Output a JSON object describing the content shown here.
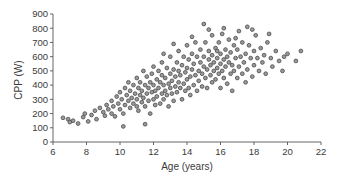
{
  "chart_data": {
    "type": "scatter",
    "title": "",
    "xlabel": "Age (years)",
    "ylabel": "CPP (W)",
    "xlim": [
      6,
      22
    ],
    "ylim": [
      0,
      900
    ],
    "x_ticks": [
      6,
      8,
      10,
      12,
      14,
      16,
      18,
      20,
      22
    ],
    "y_ticks": [
      0,
      100,
      200,
      300,
      400,
      500,
      600,
      700,
      800,
      900
    ],
    "grid": false,
    "legend": null,
    "marker": {
      "shape": "circle",
      "fill": "#9a9a9a",
      "stroke": "#4a4a4a"
    },
    "series": [
      {
        "name": "CPP vs Age",
        "points": [
          [
            6.6,
            170
          ],
          [
            6.9,
            160
          ],
          [
            7.0,
            140
          ],
          [
            7.2,
            150
          ],
          [
            7.5,
            130
          ],
          [
            7.8,
            175
          ],
          [
            7.9,
            200
          ],
          [
            8.1,
            145
          ],
          [
            8.3,
            190
          ],
          [
            8.5,
            220
          ],
          [
            8.6,
            160
          ],
          [
            8.8,
            240
          ],
          [
            9.0,
            210
          ],
          [
            9.1,
            185
          ],
          [
            9.2,
            260
          ],
          [
            9.3,
            230
          ],
          [
            9.5,
            200
          ],
          [
            9.5,
            290
          ],
          [
            9.6,
            250
          ],
          [
            9.7,
            180
          ],
          [
            9.8,
            320
          ],
          [
            9.9,
            270
          ],
          [
            10.0,
            230
          ],
          [
            10.0,
            350
          ],
          [
            10.1,
            300
          ],
          [
            10.2,
            200
          ],
          [
            10.2,
            110
          ],
          [
            10.3,
            380
          ],
          [
            10.3,
            260
          ],
          [
            10.4,
            330
          ],
          [
            10.5,
            290
          ],
          [
            10.5,
            420
          ],
          [
            10.6,
            240
          ],
          [
            10.6,
            360
          ],
          [
            10.7,
            310
          ],
          [
            10.8,
            270
          ],
          [
            10.8,
            400
          ],
          [
            10.9,
            340
          ],
          [
            11.0,
            250
          ],
          [
            11.0,
            300
          ],
          [
            11.0,
            450
          ],
          [
            11.1,
            380
          ],
          [
            11.1,
            220
          ],
          [
            11.2,
            330
          ],
          [
            11.2,
            420
          ],
          [
            11.3,
            280
          ],
          [
            11.3,
            360
          ],
          [
            11.4,
            500
          ],
          [
            11.4,
            310
          ],
          [
            11.5,
            250
          ],
          [
            11.5,
            400
          ],
          [
            11.5,
            125
          ],
          [
            11.6,
            340
          ],
          [
            11.6,
            460
          ],
          [
            11.7,
            290
          ],
          [
            11.7,
            380
          ],
          [
            11.8,
            420
          ],
          [
            11.8,
            200
          ],
          [
            11.9,
            350
          ],
          [
            11.9,
            480
          ],
          [
            12.0,
            300
          ],
          [
            12.0,
            400
          ],
          [
            12.0,
            530
          ],
          [
            12.1,
            260
          ],
          [
            12.1,
            360
          ],
          [
            12.2,
            440
          ],
          [
            12.2,
            320
          ],
          [
            12.3,
            500
          ],
          [
            12.3,
            380
          ],
          [
            12.4,
            270
          ],
          [
            12.4,
            420
          ],
          [
            12.5,
            340
          ],
          [
            12.5,
            470
          ],
          [
            12.5,
            560
          ],
          [
            12.6,
            300
          ],
          [
            12.6,
            400
          ],
          [
            12.7,
            360
          ],
          [
            12.7,
            450
          ],
          [
            12.8,
            520
          ],
          [
            12.8,
            330
          ],
          [
            12.9,
            410
          ],
          [
            12.9,
            250
          ],
          [
            13.0,
            380
          ],
          [
            13.0,
            480
          ],
          [
            13.0,
            600
          ],
          [
            13.1,
            340
          ],
          [
            13.1,
            430
          ],
          [
            13.2,
            510
          ],
          [
            13.2,
            290
          ],
          [
            13.3,
            390
          ],
          [
            13.3,
            460
          ],
          [
            13.4,
            560
          ],
          [
            13.4,
            350
          ],
          [
            13.5,
            420
          ],
          [
            13.5,
            500
          ],
          [
            13.5,
            640
          ],
          [
            13.6,
            380
          ],
          [
            13.6,
            470
          ],
          [
            13.7,
            300
          ],
          [
            13.7,
            540
          ],
          [
            13.8,
            410
          ],
          [
            13.8,
            600
          ],
          [
            13.9,
            360
          ],
          [
            13.9,
            490
          ],
          [
            14.0,
            440
          ],
          [
            14.0,
            520
          ],
          [
            14.0,
            680
          ],
          [
            14.1,
            380
          ],
          [
            14.1,
            580
          ],
          [
            14.2,
            460
          ],
          [
            14.2,
            330
          ],
          [
            14.3,
            510
          ],
          [
            14.3,
            620
          ],
          [
            14.4,
            400
          ],
          [
            14.4,
            550
          ],
          [
            14.5,
            470
          ],
          [
            14.5,
            700
          ],
          [
            14.6,
            360
          ],
          [
            14.6,
            600
          ],
          [
            14.7,
            500
          ],
          [
            14.7,
            430
          ],
          [
            14.8,
            560
          ],
          [
            14.8,
            650
          ],
          [
            14.9,
            480
          ],
          [
            14.9,
            390
          ],
          [
            15.0,
            530
          ],
          [
            15.0,
            830
          ],
          [
            15.0,
            600
          ],
          [
            15.1,
            450
          ],
          [
            15.1,
            700
          ],
          [
            15.2,
            510
          ],
          [
            15.2,
            380
          ],
          [
            15.3,
            580
          ],
          [
            15.3,
            640
          ],
          [
            15.4,
            470
          ],
          [
            15.4,
            540
          ],
          [
            15.5,
            610
          ],
          [
            15.5,
            420
          ],
          [
            15.5,
            750
          ],
          [
            15.6,
            500
          ],
          [
            15.6,
            560
          ],
          [
            15.7,
            660
          ],
          [
            15.7,
            440
          ],
          [
            15.8,
            590
          ],
          [
            15.8,
            520
          ],
          [
            15.9,
            700
          ],
          [
            15.9,
            480
          ],
          [
            16.0,
            550
          ],
          [
            16.0,
            620
          ],
          [
            16.0,
            380
          ],
          [
            16.1,
            760
          ],
          [
            16.1,
            500
          ],
          [
            16.2,
            580
          ],
          [
            16.2,
            450
          ],
          [
            16.3,
            650
          ],
          [
            16.3,
            530
          ],
          [
            16.4,
            600
          ],
          [
            16.4,
            410
          ],
          [
            16.5,
            720
          ],
          [
            16.5,
            560
          ],
          [
            16.6,
            480
          ],
          [
            16.6,
            630
          ],
          [
            16.7,
            540
          ],
          [
            16.7,
            360
          ],
          [
            16.8,
            680
          ],
          [
            16.8,
            500
          ],
          [
            16.9,
            590
          ],
          [
            17.0,
            450
          ],
          [
            17.0,
            650
          ],
          [
            17.1,
            780
          ],
          [
            17.1,
            530
          ],
          [
            17.2,
            600
          ],
          [
            17.3,
            480
          ],
          [
            17.3,
            700
          ],
          [
            17.4,
            560
          ],
          [
            17.5,
            420
          ],
          [
            17.5,
            620
          ],
          [
            17.6,
            510
          ],
          [
            17.7,
            680
          ],
          [
            17.8,
            590
          ],
          [
            17.9,
            460
          ],
          [
            18.0,
            640
          ],
          [
            18.0,
            540
          ],
          [
            18.1,
            750
          ],
          [
            18.2,
            590
          ],
          [
            18.3,
            500
          ],
          [
            18.4,
            660
          ],
          [
            18.5,
            560
          ],
          [
            18.6,
            610
          ],
          [
            18.7,
            480
          ],
          [
            18.8,
            700
          ],
          [
            19.0,
            590
          ],
          [
            19.1,
            530
          ],
          [
            19.3,
            640
          ],
          [
            19.5,
            570
          ],
          [
            19.7,
            500
          ],
          [
            19.8,
            600
          ],
          [
            20.0,
            620
          ],
          [
            20.5,
            570
          ],
          [
            20.8,
            640
          ],
          [
            16.2,
            800
          ],
          [
            15.3,
            790
          ],
          [
            17.6,
            810
          ],
          [
            14.3,
            740
          ],
          [
            13.2,
            690
          ],
          [
            12.6,
            620
          ],
          [
            18.9,
            760
          ],
          [
            17.9,
            790
          ],
          [
            16.9,
            730
          ],
          [
            15.8,
            640
          ]
        ]
      }
    ]
  }
}
